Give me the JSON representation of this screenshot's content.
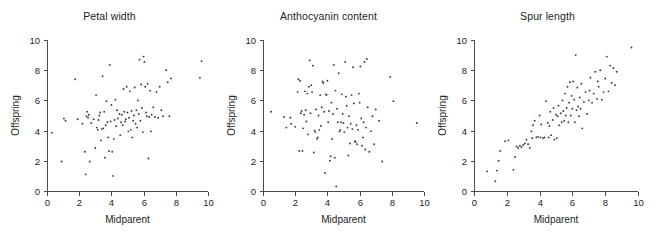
{
  "figure": {
    "background": "#ffffff",
    "point_color": "#3c3c3c",
    "axis_color": "#4a4a4a",
    "text_color": "#1d1d1d"
  },
  "panels": [
    {
      "title": "Petal width"
    },
    {
      "title": "Anthocyanin content"
    },
    {
      "title": "Spur length"
    }
  ],
  "axes": {
    "xlabel": "Midparent",
    "ylabel": "Offspring",
    "xticks": [
      "0",
      "2",
      "4",
      "6",
      "8",
      "10"
    ],
    "yticks": [
      "0",
      "2",
      "4",
      "6",
      "8",
      "10"
    ]
  },
  "chart_data": [
    {
      "type": "scatter",
      "title": "Petal width",
      "xlabel": "Midparent",
      "ylabel": "Offspring",
      "xlim": [
        0,
        10
      ],
      "ylim": [
        0,
        10
      ],
      "xticks": [
        0,
        2,
        4,
        6,
        8,
        10
      ],
      "yticks": [
        0,
        2,
        4,
        6,
        8,
        10
      ],
      "grid": false,
      "legend": "none",
      "points": [
        [
          0.3,
          3.85
        ],
        [
          0.9,
          1.95
        ],
        [
          1.05,
          4.8
        ],
        [
          1.15,
          4.65
        ],
        [
          1.75,
          7.4
        ],
        [
          1.9,
          4.75
        ],
        [
          2.2,
          4.45
        ],
        [
          2.35,
          2.6
        ],
        [
          2.4,
          1.1
        ],
        [
          2.45,
          4.95
        ],
        [
          2.5,
          5.25
        ],
        [
          2.55,
          4.85
        ],
        [
          2.6,
          5.05
        ],
        [
          2.65,
          1.95
        ],
        [
          2.75,
          4.5
        ],
        [
          2.9,
          4.75
        ],
        [
          3.0,
          2.85
        ],
        [
          3.05,
          6.35
        ],
        [
          3.1,
          4.2
        ],
        [
          3.15,
          4.05
        ],
        [
          3.2,
          4.7
        ],
        [
          3.25,
          5.0
        ],
        [
          3.3,
          5.2
        ],
        [
          3.35,
          3.35
        ],
        [
          3.4,
          4.1
        ],
        [
          3.45,
          7.6
        ],
        [
          3.5,
          4.15
        ],
        [
          3.55,
          5.25
        ],
        [
          3.6,
          2.2
        ],
        [
          3.65,
          4.35
        ],
        [
          3.7,
          5.95
        ],
        [
          3.75,
          4.55
        ],
        [
          3.8,
          3.55
        ],
        [
          3.85,
          2.65
        ],
        [
          3.9,
          8.35
        ],
        [
          3.95,
          4.6
        ],
        [
          4.0,
          5.7
        ],
        [
          4.05,
          2.6
        ],
        [
          4.1,
          1.0
        ],
        [
          4.15,
          3.45
        ],
        [
          4.2,
          4.7
        ],
        [
          4.25,
          6.05
        ],
        [
          4.3,
          4.3
        ],
        [
          4.35,
          5.35
        ],
        [
          4.4,
          4.8
        ],
        [
          4.5,
          5.1
        ],
        [
          4.55,
          3.7
        ],
        [
          4.6,
          4.55
        ],
        [
          4.65,
          5.05
        ],
        [
          4.7,
          4.35
        ],
        [
          4.75,
          6.75
        ],
        [
          4.8,
          5.25
        ],
        [
          4.85,
          4.6
        ],
        [
          4.9,
          4.75
        ],
        [
          4.95,
          6.9
        ],
        [
          5.0,
          5.2
        ],
        [
          5.05,
          3.95
        ],
        [
          5.1,
          4.85
        ],
        [
          5.15,
          6.6
        ],
        [
          5.2,
          4.05
        ],
        [
          5.25,
          5.3
        ],
        [
          5.3,
          3.55
        ],
        [
          5.35,
          4.65
        ],
        [
          5.4,
          5.0
        ],
        [
          5.45,
          6.85
        ],
        [
          5.5,
          4.45
        ],
        [
          5.55,
          5.35
        ],
        [
          5.6,
          4.2
        ],
        [
          5.65,
          6.0
        ],
        [
          5.7,
          5.1
        ],
        [
          5.75,
          8.7
        ],
        [
          5.8,
          4.65
        ],
        [
          5.85,
          7.05
        ],
        [
          5.9,
          5.5
        ],
        [
          5.95,
          3.9
        ],
        [
          6.0,
          8.9
        ],
        [
          6.05,
          8.55
        ],
        [
          6.1,
          6.9
        ],
        [
          6.15,
          5.2
        ],
        [
          6.2,
          4.95
        ],
        [
          6.25,
          7.1
        ],
        [
          6.3,
          2.15
        ],
        [
          6.35,
          4.9
        ],
        [
          6.4,
          6.65
        ],
        [
          6.45,
          3.95
        ],
        [
          6.5,
          5.05
        ],
        [
          6.6,
          5.55
        ],
        [
          6.7,
          4.9
        ],
        [
          6.8,
          6.55
        ],
        [
          6.9,
          4.85
        ],
        [
          7.0,
          6.9
        ],
        [
          7.1,
          5.35
        ],
        [
          7.2,
          4.95
        ],
        [
          7.4,
          8.0
        ],
        [
          7.5,
          7.2
        ],
        [
          7.6,
          4.95
        ],
        [
          7.7,
          7.45
        ],
        [
          9.5,
          7.5
        ],
        [
          9.6,
          8.6
        ]
      ]
    },
    {
      "type": "scatter",
      "title": "Anthocyanin content",
      "xlabel": "Midparent",
      "ylabel": "Offspring",
      "xlim": [
        0,
        10
      ],
      "ylim": [
        0,
        10
      ],
      "xticks": [
        0,
        2,
        4,
        6,
        8,
        10
      ],
      "yticks": [
        0,
        2,
        4,
        6,
        8,
        10
      ],
      "grid": false,
      "legend": "none",
      "points": [
        [
          0.5,
          5.25
        ],
        [
          1.3,
          4.9
        ],
        [
          1.45,
          4.2
        ],
        [
          1.7,
          4.85
        ],
        [
          1.75,
          4.45
        ],
        [
          2.0,
          4.25
        ],
        [
          2.15,
          6.55
        ],
        [
          2.2,
          7.4
        ],
        [
          2.25,
          2.65
        ],
        [
          2.3,
          7.3
        ],
        [
          2.35,
          5.15
        ],
        [
          2.4,
          5.3
        ],
        [
          2.45,
          2.65
        ],
        [
          2.5,
          4.15
        ],
        [
          2.55,
          5.05
        ],
        [
          2.6,
          6.6
        ],
        [
          2.65,
          5.35
        ],
        [
          2.7,
          4.6
        ],
        [
          2.75,
          6.45
        ],
        [
          2.8,
          3.75
        ],
        [
          2.85,
          6.9
        ],
        [
          2.9,
          8.65
        ],
        [
          2.95,
          5.15
        ],
        [
          3.0,
          7.0
        ],
        [
          3.05,
          6.55
        ],
        [
          3.1,
          8.3
        ],
        [
          3.15,
          2.55
        ],
        [
          3.2,
          4.0
        ],
        [
          3.25,
          3.9
        ],
        [
          3.3,
          5.4
        ],
        [
          3.35,
          3.45
        ],
        [
          3.4,
          3.55
        ],
        [
          3.45,
          5.0
        ],
        [
          3.5,
          4.05
        ],
        [
          3.55,
          6.35
        ],
        [
          3.6,
          4.3
        ],
        [
          3.65,
          5.55
        ],
        [
          3.7,
          7.25
        ],
        [
          3.75,
          7.15
        ],
        [
          3.8,
          5.25
        ],
        [
          3.85,
          1.2
        ],
        [
          3.9,
          6.4
        ],
        [
          3.95,
          6.35
        ],
        [
          4.0,
          7.3
        ],
        [
          4.05,
          4.55
        ],
        [
          4.1,
          5.3
        ],
        [
          4.15,
          2.0
        ],
        [
          4.2,
          2.3
        ],
        [
          4.25,
          5.85
        ],
        [
          4.3,
          3.45
        ],
        [
          4.35,
          5.1
        ],
        [
          4.4,
          8.35
        ],
        [
          4.45,
          2.2
        ],
        [
          4.5,
          6.65
        ],
        [
          4.55,
          0.3
        ],
        [
          4.6,
          5.45
        ],
        [
          4.65,
          4.55
        ],
        [
          4.7,
          7.8
        ],
        [
          4.75,
          3.95
        ],
        [
          4.8,
          4.05
        ],
        [
          4.85,
          4.55
        ],
        [
          4.9,
          6.4
        ],
        [
          4.95,
          5.1
        ],
        [
          5.0,
          4.5
        ],
        [
          5.05,
          3.9
        ],
        [
          5.1,
          8.55
        ],
        [
          5.15,
          6.25
        ],
        [
          5.2,
          5.65
        ],
        [
          5.25,
          4.2
        ],
        [
          5.3,
          2.35
        ],
        [
          5.35,
          4.95
        ],
        [
          5.4,
          3.15
        ],
        [
          5.45,
          4.45
        ],
        [
          5.5,
          6.35
        ],
        [
          5.55,
          4.1
        ],
        [
          5.6,
          8.2
        ],
        [
          5.65,
          5.8
        ],
        [
          5.7,
          3.3
        ],
        [
          5.75,
          3.25
        ],
        [
          5.8,
          4.35
        ],
        [
          5.85,
          3.1
        ],
        [
          5.9,
          4.05
        ],
        [
          5.95,
          6.45
        ],
        [
          6.0,
          5.85
        ],
        [
          6.05,
          8.25
        ],
        [
          6.1,
          4.8
        ],
        [
          6.15,
          3.0
        ],
        [
          6.2,
          3.55
        ],
        [
          6.25,
          4.55
        ],
        [
          6.3,
          8.55
        ],
        [
          6.35,
          2.75
        ],
        [
          6.4,
          4.2
        ],
        [
          6.45,
          8.75
        ],
        [
          6.5,
          5.55
        ],
        [
          6.6,
          2.6
        ],
        [
          6.7,
          3.95
        ],
        [
          6.8,
          4.95
        ],
        [
          6.9,
          3.1
        ],
        [
          7.0,
          5.4
        ],
        [
          7.2,
          4.65
        ],
        [
          7.4,
          1.95
        ],
        [
          7.9,
          7.55
        ],
        [
          8.1,
          5.95
        ],
        [
          9.55,
          4.5
        ]
      ]
    },
    {
      "type": "scatter",
      "title": "Spur length",
      "xlabel": "Midparent",
      "ylabel": "Offspring",
      "xlim": [
        0,
        10
      ],
      "ylim": [
        0,
        10
      ],
      "xticks": [
        0,
        2,
        4,
        6,
        8,
        10
      ],
      "yticks": [
        0,
        2,
        4,
        6,
        8,
        10
      ],
      "grid": false,
      "legend": "none",
      "points": [
        [
          0.8,
          1.3
        ],
        [
          1.3,
          0.65
        ],
        [
          1.4,
          1.35
        ],
        [
          1.5,
          2.0
        ],
        [
          1.6,
          2.65
        ],
        [
          1.9,
          3.3
        ],
        [
          2.1,
          3.35
        ],
        [
          2.4,
          1.4
        ],
        [
          2.5,
          2.25
        ],
        [
          2.6,
          2.95
        ],
        [
          2.7,
          2.85
        ],
        [
          2.8,
          3.0
        ],
        [
          2.9,
          2.9
        ],
        [
          3.0,
          3.05
        ],
        [
          3.1,
          3.15
        ],
        [
          3.2,
          3.4
        ],
        [
          3.3,
          3.1
        ],
        [
          3.4,
          2.85
        ],
        [
          3.5,
          3.95
        ],
        [
          3.55,
          3.5
        ],
        [
          3.6,
          4.35
        ],
        [
          3.7,
          4.65
        ],
        [
          3.8,
          3.55
        ],
        [
          3.9,
          3.6
        ],
        [
          4.0,
          5.0
        ],
        [
          4.05,
          3.55
        ],
        [
          4.1,
          4.4
        ],
        [
          4.2,
          3.5
        ],
        [
          4.3,
          3.55
        ],
        [
          4.4,
          5.95
        ],
        [
          4.5,
          4.5
        ],
        [
          4.55,
          3.55
        ],
        [
          4.6,
          4.3
        ],
        [
          4.65,
          5.25
        ],
        [
          4.7,
          3.7
        ],
        [
          4.8,
          4.7
        ],
        [
          4.85,
          5.5
        ],
        [
          4.9,
          3.4
        ],
        [
          5.0,
          5.05
        ],
        [
          5.05,
          3.5
        ],
        [
          5.1,
          4.95
        ],
        [
          5.15,
          5.65
        ],
        [
          5.2,
          4.35
        ],
        [
          5.3,
          5.15
        ],
        [
          5.35,
          4.55
        ],
        [
          5.4,
          6.0
        ],
        [
          5.45,
          5.3
        ],
        [
          5.5,
          4.65
        ],
        [
          5.55,
          6.45
        ],
        [
          5.6,
          5.0
        ],
        [
          5.65,
          5.5
        ],
        [
          5.7,
          6.9
        ],
        [
          5.75,
          4.55
        ],
        [
          5.8,
          5.85
        ],
        [
          5.85,
          7.2
        ],
        [
          5.9,
          5.0
        ],
        [
          5.95,
          6.3
        ],
        [
          6.0,
          5.45
        ],
        [
          6.05,
          7.25
        ],
        [
          6.1,
          6.05
        ],
        [
          6.15,
          4.55
        ],
        [
          6.2,
          9.0
        ],
        [
          6.25,
          5.35
        ],
        [
          6.3,
          6.85
        ],
        [
          6.35,
          5.6
        ],
        [
          6.4,
          4.95
        ],
        [
          6.45,
          6.2
        ],
        [
          6.5,
          5.45
        ],
        [
          6.55,
          7.1
        ],
        [
          6.6,
          4.15
        ],
        [
          6.7,
          5.9
        ],
        [
          6.8,
          6.55
        ],
        [
          6.9,
          5.1
        ],
        [
          7.0,
          6.0
        ],
        [
          7.05,
          6.65
        ],
        [
          7.1,
          7.5
        ],
        [
          7.2,
          5.85
        ],
        [
          7.3,
          6.45
        ],
        [
          7.4,
          7.9
        ],
        [
          7.5,
          6.1
        ],
        [
          7.55,
          7.25
        ],
        [
          7.6,
          6.9
        ],
        [
          7.7,
          8.0
        ],
        [
          7.8,
          6.05
        ],
        [
          7.9,
          6.55
        ],
        [
          8.0,
          7.45
        ],
        [
          8.1,
          8.9
        ],
        [
          8.2,
          6.6
        ],
        [
          8.3,
          8.3
        ],
        [
          8.4,
          7.15
        ],
        [
          8.5,
          8.15
        ],
        [
          8.6,
          7.0
        ],
        [
          8.7,
          7.9
        ],
        [
          9.6,
          9.5
        ]
      ]
    }
  ]
}
